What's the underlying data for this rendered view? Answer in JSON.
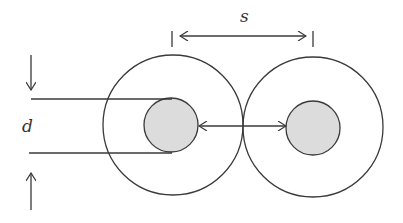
{
  "labels": {
    "spacing": "s",
    "diameter": "d"
  },
  "colors": {
    "stroke": "#3a3a3a",
    "conductor_fill": "#dcdcdc",
    "background": "#ffffff"
  },
  "conductors": [
    {
      "name": "left",
      "cx": 173,
      "cy": 125,
      "outer_r": 70,
      "inner_r": 27
    },
    {
      "name": "right",
      "cx": 313,
      "cy": 127,
      "outer_r": 70,
      "inner_r": 27
    }
  ]
}
